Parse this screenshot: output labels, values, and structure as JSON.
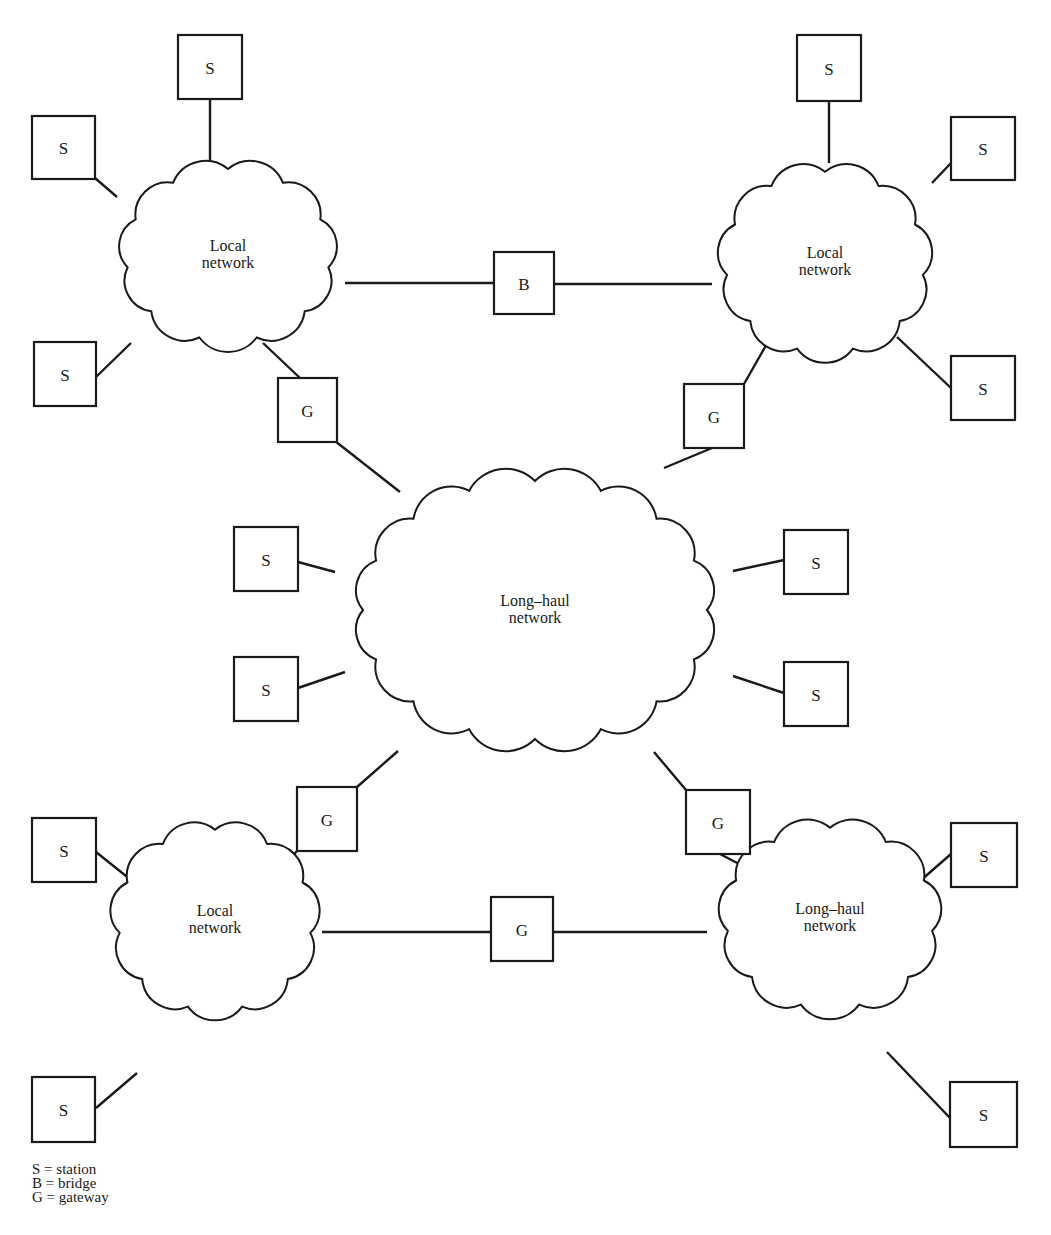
{
  "figure": {
    "type": "network-topology-diagram",
    "clouds": [
      {
        "id": "local-tl",
        "label": [
          "Local",
          "network"
        ],
        "cx": 228,
        "cy": 255,
        "rx": 118,
        "ry": 100
      },
      {
        "id": "local-tr",
        "label": [
          "Local",
          "network"
        ],
        "cx": 825,
        "cy": 262,
        "rx": 115,
        "ry": 105
      },
      {
        "id": "longhaul-center",
        "label": [
          "Long–haul",
          "network"
        ],
        "cx": 535,
        "cy": 610,
        "rx": 200,
        "ry": 150
      },
      {
        "id": "local-bl",
        "label": [
          "Local",
          "network"
        ],
        "cx": 215,
        "cy": 920,
        "rx": 112,
        "ry": 105
      },
      {
        "id": "longhaul-br",
        "label": [
          "Long–haul",
          "network"
        ],
        "cx": 830,
        "cy": 918,
        "rx": 120,
        "ry": 105
      }
    ],
    "nodes": [
      {
        "id": "s1",
        "label": "S",
        "x": 178,
        "y": 35,
        "w": 64,
        "h": 64
      },
      {
        "id": "s2",
        "label": "S",
        "x": 32,
        "y": 116,
        "w": 63,
        "h": 63
      },
      {
        "id": "s3",
        "label": "S",
        "x": 34,
        "y": 342,
        "w": 62,
        "h": 64
      },
      {
        "id": "b1",
        "label": "B",
        "x": 494,
        "y": 252,
        "w": 60,
        "h": 62
      },
      {
        "id": "g1",
        "label": "G",
        "x": 278,
        "y": 378,
        "w": 59,
        "h": 64
      },
      {
        "id": "s4",
        "label": "S",
        "x": 797,
        "y": 35,
        "w": 64,
        "h": 66
      },
      {
        "id": "s5",
        "label": "S",
        "x": 951,
        "y": 117,
        "w": 64,
        "h": 63
      },
      {
        "id": "s6",
        "label": "S",
        "x": 951,
        "y": 356,
        "w": 64,
        "h": 64
      },
      {
        "id": "g2",
        "label": "G",
        "x": 684,
        "y": 384,
        "w": 60,
        "h": 64
      },
      {
        "id": "s7",
        "label": "S",
        "x": 234,
        "y": 527,
        "w": 64,
        "h": 64
      },
      {
        "id": "s8",
        "label": "S",
        "x": 784,
        "y": 530,
        "w": 64,
        "h": 64
      },
      {
        "id": "s9",
        "label": "S",
        "x": 234,
        "y": 657,
        "w": 64,
        "h": 64
      },
      {
        "id": "s10",
        "label": "S",
        "x": 784,
        "y": 662,
        "w": 64,
        "h": 64
      },
      {
        "id": "g3",
        "label": "G",
        "x": 297,
        "y": 787,
        "w": 60,
        "h": 64
      },
      {
        "id": "g4",
        "label": "G",
        "x": 686,
        "y": 790,
        "w": 64,
        "h": 64
      },
      {
        "id": "s11",
        "label": "S",
        "x": 32,
        "y": 818,
        "w": 64,
        "h": 64
      },
      {
        "id": "s12",
        "label": "S",
        "x": 951,
        "y": 823,
        "w": 66,
        "h": 64
      },
      {
        "id": "g5",
        "label": "G",
        "x": 491,
        "y": 897,
        "w": 62,
        "h": 64
      },
      {
        "id": "s13",
        "label": "S",
        "x": 32,
        "y": 1077,
        "w": 63,
        "h": 65
      },
      {
        "id": "s14",
        "label": "S",
        "x": 950,
        "y": 1082,
        "w": 67,
        "h": 65
      }
    ],
    "links": [
      [
        210,
        99,
        210,
        160
      ],
      [
        95,
        178,
        117,
        197
      ],
      [
        96,
        377,
        131,
        343
      ],
      [
        345,
        283,
        494,
        283
      ],
      [
        554,
        284,
        712,
        284
      ],
      [
        263,
        343,
        300,
        378
      ],
      [
        335,
        441,
        400,
        492
      ],
      [
        829,
        101,
        829,
        163
      ],
      [
        951,
        163,
        932,
        183
      ],
      [
        951,
        388,
        897,
        337
      ],
      [
        777,
        326,
        744,
        384
      ],
      [
        712,
        448,
        664,
        468
      ],
      [
        298,
        562,
        335,
        572
      ],
      [
        784,
        560,
        733,
        571
      ],
      [
        298,
        688,
        345,
        672
      ],
      [
        784,
        693,
        733,
        676
      ],
      [
        357,
        787,
        398,
        751
      ],
      [
        654,
        752,
        686,
        790
      ],
      [
        297,
        851,
        265,
        885
      ],
      [
        96,
        852,
        146,
        892
      ],
      [
        322,
        932,
        491,
        932
      ],
      [
        553,
        932,
        707,
        932
      ],
      [
        720,
        854,
        785,
        888
      ],
      [
        951,
        854,
        912,
        888
      ],
      [
        96,
        1108,
        137,
        1073
      ],
      [
        950,
        1118,
        887,
        1052
      ]
    ]
  },
  "legend": {
    "items": [
      {
        "key": "S",
        "meaning": "station",
        "text": "S = station"
      },
      {
        "key": "B",
        "meaning": "bridge",
        "text": "B = bridge"
      },
      {
        "key": "G",
        "meaning": "gateway",
        "text": "G = gateway"
      }
    ]
  },
  "colors": {
    "ink": "#1a1a1a",
    "paper": "#ffffff"
  }
}
